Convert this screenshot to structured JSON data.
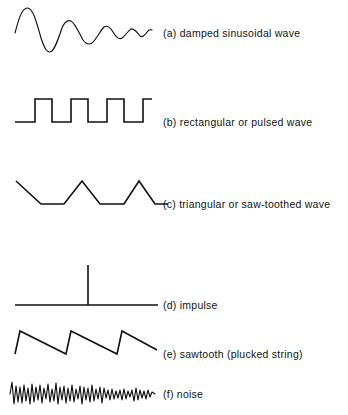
{
  "figure": {
    "background_color": "#ffffff",
    "ink_color": "#111111",
    "rows": [
      {
        "key": "damped-sinusoidal-wave",
        "label": "(a)  damped sinusoidal wave",
        "label_x": 163,
        "label_y": 28,
        "waveform_type": "damped-sine",
        "baseline_y": 33,
        "x_start": 15,
        "x_end": 152,
        "peak_y": 8,
        "trough_y": 52
      },
      {
        "key": "rectangular-or-pulsed-wave",
        "label": "(b)  rectangular or pulsed wave",
        "label_x": 163,
        "label_y": 117,
        "waveform_type": "square-pulse",
        "baseline_y": 122,
        "top_y": 99,
        "x_start": 15,
        "x_end": 152,
        "pulse_edges": [
          35,
          52,
          71,
          88,
          107,
          124,
          143
        ]
      },
      {
        "key": "triangular-or-saw-toothed-wave",
        "label": "(c)  triangular or saw-toothed wave",
        "label_x": 163,
        "label_y": 199,
        "waveform_type": "triangle",
        "baseline_y": 204,
        "top_y": 181,
        "x_start": 16,
        "x_end": 155
      },
      {
        "key": "impulse",
        "label": "(d)  impulse",
        "label_x": 163,
        "label_y": 300,
        "waveform_type": "impulse",
        "baseline_y": 305,
        "spike_x": 88,
        "spike_top_y": 265,
        "x_start": 15,
        "x_end": 158
      },
      {
        "key": "sawtooth-plucked-string",
        "label": "(e)  sawtooth (plucked string)",
        "label_x": 163,
        "label_y": 349,
        "waveform_type": "sawtooth",
        "baseline_y": 354,
        "top_y": 331,
        "x_start": 15,
        "x_end": 157
      },
      {
        "key": "noise",
        "label": "(f)  noise",
        "label_x": 163,
        "label_y": 393,
        "waveform_type": "noise",
        "center_y": 394,
        "amplitude": 15,
        "x_start": 10,
        "x_end": 155
      }
    ]
  },
  "chart_data": {
    "type": "line",
    "title": "",
    "xlabel": "",
    "ylabel": "",
    "series": [
      {
        "name": "(a) damped sinusoidal wave",
        "waveform": "damped-sine",
        "points": [
          [
            15,
            33
          ],
          [
            18,
            20
          ],
          [
            22,
            10
          ],
          [
            27,
            8
          ],
          [
            32,
            14
          ],
          [
            37,
            26
          ],
          [
            41,
            38
          ],
          [
            45,
            48
          ],
          [
            49,
            52
          ],
          [
            54,
            48
          ],
          [
            58,
            38
          ],
          [
            62,
            28
          ],
          [
            66,
            22
          ],
          [
            70,
            20
          ],
          [
            74,
            23
          ],
          [
            78,
            30
          ],
          [
            82,
            38
          ],
          [
            86,
            43
          ],
          [
            90,
            44
          ],
          [
            94,
            41
          ],
          [
            98,
            35
          ],
          [
            102,
            29
          ],
          [
            105,
            26
          ],
          [
            109,
            27
          ],
          [
            112,
            31
          ],
          [
            116,
            36
          ],
          [
            119,
            39
          ],
          [
            122,
            38
          ],
          [
            125,
            34
          ],
          [
            128,
            30
          ],
          [
            131,
            29
          ],
          [
            134,
            31
          ],
          [
            137,
            35
          ],
          [
            140,
            37
          ],
          [
            143,
            35
          ],
          [
            146,
            32
          ],
          [
            149,
            30
          ],
          [
            152,
            30
          ]
        ]
      },
      {
        "name": "(b) rectangular or pulsed wave",
        "waveform": "square-pulse",
        "points": [
          [
            15,
            122
          ],
          [
            35,
            122
          ],
          [
            35,
            99
          ],
          [
            52,
            99
          ],
          [
            52,
            122
          ],
          [
            71,
            122
          ],
          [
            71,
            99
          ],
          [
            88,
            99
          ],
          [
            88,
            122
          ],
          [
            107,
            122
          ],
          [
            107,
            99
          ],
          [
            124,
            99
          ],
          [
            124,
            122
          ],
          [
            143,
            122
          ],
          [
            143,
            99
          ],
          [
            152,
            99
          ]
        ]
      },
      {
        "name": "(c) triangular or saw-toothed wave",
        "waveform": "triangle",
        "points": [
          [
            16,
            181
          ],
          [
            41,
            204
          ],
          [
            64,
            204
          ],
          [
            82,
            181
          ],
          [
            100,
            204
          ],
          [
            124,
            204
          ],
          [
            139,
            181
          ],
          [
            155,
            204
          ],
          [
            168,
            204
          ]
        ]
      },
      {
        "name": "(d) impulse",
        "waveform": "impulse",
        "points": [
          [
            15,
            305
          ],
          [
            88,
            305
          ],
          [
            88,
            265
          ],
          [
            88,
            305
          ],
          [
            158,
            305
          ]
        ]
      },
      {
        "name": "(e) sawtooth (plucked string)",
        "waveform": "sawtooth",
        "points": [
          [
            15,
            354
          ],
          [
            20,
            331
          ],
          [
            66,
            354
          ],
          [
            71,
            331
          ],
          [
            117,
            354
          ],
          [
            122,
            331
          ],
          [
            157,
            350
          ]
        ]
      },
      {
        "name": "(f) noise",
        "waveform": "noise",
        "points": [
          [
            10,
            394
          ],
          [
            12,
            382
          ],
          [
            14,
            404
          ],
          [
            16,
            386
          ],
          [
            18,
            402
          ],
          [
            20,
            387
          ],
          [
            22,
            403
          ],
          [
            24,
            385
          ],
          [
            26,
            401
          ],
          [
            28,
            388
          ],
          [
            30,
            404
          ],
          [
            32,
            384
          ],
          [
            34,
            402
          ],
          [
            36,
            387
          ],
          [
            38,
            400
          ],
          [
            40,
            385
          ],
          [
            42,
            403
          ],
          [
            44,
            388
          ],
          [
            46,
            399
          ],
          [
            48,
            384
          ],
          [
            50,
            402
          ],
          [
            52,
            389
          ],
          [
            54,
            401
          ],
          [
            56,
            383
          ],
          [
            58,
            404
          ],
          [
            60,
            387
          ],
          [
            62,
            400
          ],
          [
            64,
            386
          ],
          [
            66,
            403
          ],
          [
            68,
            388
          ],
          [
            70,
            401
          ],
          [
            72,
            385
          ],
          [
            74,
            402
          ],
          [
            76,
            389
          ],
          [
            78,
            399
          ],
          [
            80,
            386
          ],
          [
            82,
            404
          ],
          [
            84,
            387
          ],
          [
            86,
            400
          ],
          [
            88,
            388
          ],
          [
            90,
            402
          ],
          [
            92,
            385
          ],
          [
            94,
            401
          ],
          [
            96,
            389
          ],
          [
            98,
            399
          ],
          [
            100,
            387
          ],
          [
            102,
            403
          ],
          [
            104,
            388
          ],
          [
            106,
            398
          ],
          [
            108,
            390
          ],
          [
            110,
            400
          ],
          [
            112,
            389
          ],
          [
            114,
            399
          ],
          [
            116,
            391
          ],
          [
            118,
            398
          ],
          [
            120,
            390
          ],
          [
            122,
            400
          ],
          [
            124,
            389
          ],
          [
            126,
            399
          ],
          [
            128,
            391
          ],
          [
            130,
            397
          ],
          [
            132,
            390
          ],
          [
            134,
            401
          ],
          [
            136,
            388
          ],
          [
            138,
            400
          ],
          [
            140,
            390
          ],
          [
            142,
            398
          ],
          [
            144,
            391
          ],
          [
            146,
            399
          ],
          [
            148,
            390
          ],
          [
            150,
            397
          ],
          [
            152,
            392
          ],
          [
            155,
            394
          ]
        ]
      }
    ]
  }
}
